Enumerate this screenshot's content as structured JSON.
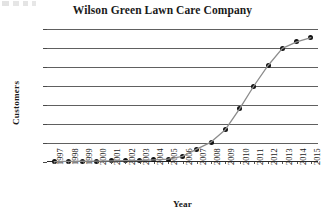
{
  "chart_data": {
    "type": "line",
    "title": "Wilson Green Lawn Care Company",
    "xlabel": "Year",
    "ylabel": "Customers",
    "grid": true,
    "legend": false,
    "marker": "filled-circle",
    "line_color": "#8c8c8c",
    "marker_color": "#121212",
    "grid_color": "#606060",
    "xlim": [
      1996.5,
      2015.5
    ],
    "ylim": [
      0,
      7000
    ],
    "ytick_labels": [
      "7,000",
      "6,000",
      "5,000",
      "4,000",
      "3,000",
      "2,000",
      "1,000",
      "0"
    ],
    "ytick_values": [
      7000,
      6000,
      5000,
      4000,
      3000,
      2000,
      1000,
      0
    ],
    "categories": [
      "1997",
      "1998",
      "1999",
      "2000",
      "2001",
      "2002",
      "2003",
      "2004",
      "2005",
      "2006",
      "2007",
      "2008",
      "2009",
      "2010",
      "2011",
      "2012",
      "2013",
      "2014",
      "2015"
    ],
    "x": [
      1997,
      1998,
      1999,
      2000,
      2001,
      2002,
      2003,
      2004,
      2005,
      2006,
      2007,
      2008,
      2009,
      2010,
      2011,
      2012,
      2013,
      2014,
      2015
    ],
    "values": [
      20,
      30,
      40,
      50,
      60,
      70,
      80,
      110,
      150,
      300,
      680,
      1050,
      1700,
      2800,
      4000,
      5080,
      5980,
      6320,
      6550
    ],
    "series": [
      {
        "name": "Customers",
        "values": [
          20,
          30,
          40,
          50,
          60,
          70,
          80,
          110,
          150,
          300,
          680,
          1050,
          1700,
          2800,
          4000,
          5080,
          5980,
          6320,
          6550
        ]
      }
    ]
  }
}
